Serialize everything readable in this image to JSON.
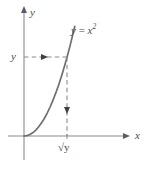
{
  "figure": {
    "background_color": "#ffffff",
    "axis_color": "#8a8a8f",
    "curve_color": "#6e6e78",
    "dash_color": "#8a8a90",
    "text_color": "#4a4a4a",
    "axes": {
      "y_axis_label": "y",
      "x_axis_label": "x"
    },
    "curve": {
      "label_lhs": "y",
      "label_eq": " = ",
      "label_base": "x",
      "label_exponent": "2",
      "label_full": "y = x2"
    },
    "annotations": {
      "y_tick_label": "y",
      "x_tick_label_radical": "√",
      "x_tick_label_radicand": "y",
      "x_tick_label_full": "√y"
    }
  },
  "chart_data": {
    "type": "line",
    "title": "",
    "xlabel": "x",
    "ylabel": "y",
    "function": "y = x^2",
    "grid": false,
    "legend": null,
    "xlim": [
      -0.55,
      2.9
    ],
    "ylim": [
      -0.7,
      3.6
    ],
    "series": [
      {
        "name": "y = x2",
        "x": [
          0.0,
          0.1,
          0.2,
          0.3,
          0.4,
          0.5,
          0.6,
          0.7,
          0.8,
          0.9,
          1.0,
          1.1,
          1.2,
          1.3,
          1.4,
          1.5,
          1.6,
          1.7,
          1.75
        ],
        "y": [
          0.0,
          0.01,
          0.04,
          0.09,
          0.16,
          0.25,
          0.36,
          0.49,
          0.64,
          0.81,
          1.0,
          1.21,
          1.44,
          1.69,
          1.96,
          2.25,
          2.56,
          2.89,
          3.06
        ]
      }
    ],
    "annotations": [
      {
        "kind": "dashed-arrow-horizontal",
        "label": "y",
        "from": [
          0.0,
          2.2
        ],
        "to": [
          1.48,
          2.2
        ],
        "arrow_at": [
          0.6,
          2.2
        ],
        "direction": "right"
      },
      {
        "kind": "dashed-arrow-vertical",
        "label": "√y",
        "from": [
          1.48,
          2.2
        ],
        "to": [
          1.48,
          0.0
        ],
        "arrow_at": [
          1.48,
          0.75
        ],
        "direction": "down"
      }
    ],
    "tick_labels": {
      "y": [
        "y"
      ],
      "x": [
        "√y"
      ]
    }
  }
}
